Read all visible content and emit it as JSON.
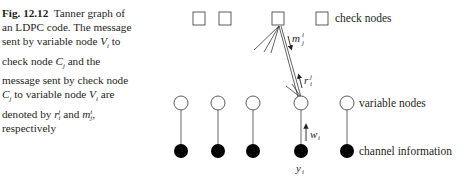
{
  "caption": {
    "fig_label": "Fig. 12.12",
    "line1": "Tanner graph of",
    "line2": "an LDPC code. The message",
    "line3_pre": "sent by variable node ",
    "line3_var": "V",
    "line3_sub": "i",
    "line3_post": " to",
    "line4_pre": "check node ",
    "line4_var": "C",
    "line4_sub": "j",
    "line4_post": " and the",
    "line5": "message sent by check node",
    "line6_var1": "C",
    "line6_sub1": "j",
    "line6_mid": " to variable node ",
    "line6_var2": "V",
    "line6_sub2": "i",
    "line6_post": " are",
    "line7_pre": "denoted by ",
    "line7_r": "r",
    "line7_rsub": "i",
    "line7_rsup": "j",
    "line7_mid": " and ",
    "line7_m": "m",
    "line7_msub": "j",
    "line7_msup": "i",
    "line7_post": ",",
    "line8": "respectively"
  },
  "diagram": {
    "labels": {
      "check_nodes": "check nodes",
      "variable_nodes": "variable nodes",
      "channel_information": "channel information"
    },
    "math_labels": {
      "m": "m",
      "m_sup": "i",
      "m_sub": "j",
      "r": "r",
      "r_sup": "j",
      "r_sub": "i",
      "w": "w",
      "w_sub": "i",
      "y": "y",
      "y_sub": "i"
    },
    "check_node_count": 4,
    "variable_node_count": 5,
    "channel_node_count": 5
  }
}
